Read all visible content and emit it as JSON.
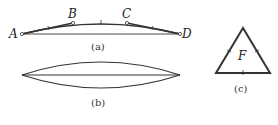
{
  "figures": {
    "a": {
      "caption": "(a)",
      "points": {
        "A": "A",
        "B": "B",
        "C": "C",
        "D": "D"
      }
    },
    "b": {
      "caption": "(b)"
    },
    "c": {
      "caption": "(c)",
      "center_label": "F"
    }
  },
  "colors": {
    "line": "#333333",
    "background": "#ffffff"
  }
}
